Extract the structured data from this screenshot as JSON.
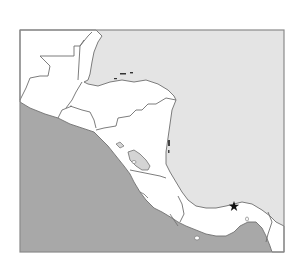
{
  "map": {
    "title": "",
    "region": "Central America (outline map)",
    "labels": [],
    "colors": {
      "background": "#ffffff",
      "pacific_ocean": "#a8a8a8",
      "caribbean_sea": "#e4e4e4",
      "land": "#ffffff",
      "border": "#6e6e6e",
      "frame": "#8a8a8a",
      "lake": "#d4d4d4",
      "marker": "#111111"
    },
    "marker": {
      "icon": "star-icon",
      "description": "star marker on the Caribbean coast of Panama"
    },
    "features": [
      "Guatemala",
      "Belize",
      "Honduras",
      "El Salvador",
      "Nicaragua",
      "Costa Rica",
      "Panama",
      "Lake Nicaragua",
      "Bay Islands"
    ]
  }
}
